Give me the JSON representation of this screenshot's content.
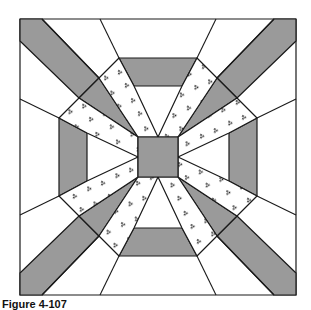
{
  "figure": {
    "kind": "quilt-block-pattern",
    "colors": {
      "background": "#ffffff",
      "stroke": "#1a1a1a",
      "gray_fill": "#9a9a9a",
      "dot_fill": "#ffffff",
      "dot_color": "#222222"
    },
    "center": [
      158,
      157
    ],
    "outer_half_size": 138,
    "center_square_half_size": 20,
    "pieces": {
      "center_square": "gray",
      "side_bars": "gray",
      "corner_diagonal_bands": "gray",
      "radial_strips": "stippled",
      "remaining": "white"
    }
  },
  "caption": {
    "label": "Figure 4-107",
    "rest": "Lancaster Rose"
  }
}
